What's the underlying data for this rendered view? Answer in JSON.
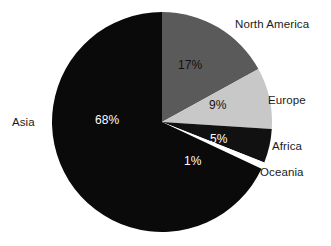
{
  "chart_data": {
    "type": "pie",
    "title": "",
    "subtitle": "",
    "xlabel": "",
    "ylabel": "",
    "legend_position": "outside-labels",
    "grid": false,
    "start_angle_deg": 0,
    "direction": "clockwise",
    "categories": [
      "North America",
      "Europe",
      "Africa",
      "Oceania",
      "Asia"
    ],
    "values": [
      17,
      9,
      5,
      1,
      68
    ],
    "value_labels": [
      "17%",
      "9%",
      "5%",
      "1%",
      "68%"
    ],
    "colors": [
      "#5a5a5a",
      "#c8c8c8",
      "#111111",
      "#ffffff",
      "#0a0a0a"
    ],
    "slices": [
      {
        "name": "North America",
        "value": 17,
        "value_label": "17%",
        "color": "#5a5a5a",
        "label_color": "#111111"
      },
      {
        "name": "Europe",
        "value": 9,
        "value_label": "9%",
        "color": "#c8c8c8",
        "label_color": "#111111"
      },
      {
        "name": "Africa",
        "value": 5,
        "value_label": "5%",
        "color": "#111111",
        "label_color": "#ffffff"
      },
      {
        "name": "Oceania",
        "value": 1,
        "value_label": "1%",
        "color": "#ffffff",
        "label_color": "#ffffff"
      },
      {
        "name": "Asia",
        "value": 68,
        "value_label": "68%",
        "color": "#0a0a0a",
        "label_color": "#ffffff"
      }
    ]
  },
  "geometry": {
    "center_x": 162,
    "center_y": 122,
    "radius": 110
  }
}
